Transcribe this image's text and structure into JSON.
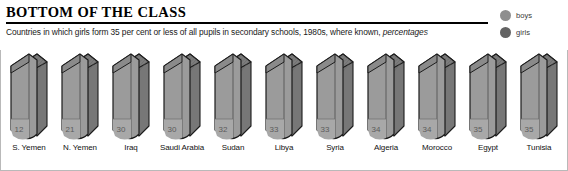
{
  "header": {
    "title": "BOTTOM OF THE CLASS",
    "subtitle_main": "Countries in which girls form 35 per cent or less of all pupils in secondary schools, 1980s, where known,",
    "subtitle_italic": "percentages"
  },
  "legend": {
    "position": "top-right",
    "items": [
      {
        "label": "boys",
        "color": "#8e8e8e",
        "icon": "circle-icon"
      },
      {
        "label": "girls",
        "color": "#636363",
        "icon": "circle-icon"
      }
    ]
  },
  "colors": {
    "background": "#ffffff",
    "book_face": "#9b9b9b",
    "book_spine": "#8a8a8a",
    "book_pages": "#777777",
    "book_top": "#7d7d7d",
    "book_outline": "#1c1c1c",
    "value_badge": "#a8a8a8",
    "value_text": "#5b5b5b",
    "frame": "#b9b9b9",
    "text": "#111111"
  },
  "chart_data": {
    "type": "bar",
    "title": "BOTTOM OF THE CLASS",
    "subtitle": "Countries in which girls form 35 per cent or less of all pupils in secondary schools, 1980s, where known, percentages",
    "xlabel": "",
    "ylabel": "percentages",
    "ylim": [
      0,
      35
    ],
    "grid": false,
    "legend_position": "top-right",
    "categories": [
      "S. Yemen",
      "N. Yemen",
      "Iraq",
      "Saudi Arabia",
      "Sudan",
      "Libya",
      "Syria",
      "Algeria",
      "Morocco",
      "Egypt",
      "Tunisia"
    ],
    "values": [
      12,
      21,
      30,
      30,
      32,
      33,
      33,
      34,
      34,
      35,
      35
    ],
    "series": [
      {
        "name": "girls",
        "values": [
          12,
          21,
          30,
          30,
          32,
          33,
          33,
          34,
          34,
          35,
          35
        ]
      }
    ]
  },
  "books": [
    {
      "country": "S. Yemen",
      "value": "12"
    },
    {
      "country": "N. Yemen",
      "value": "21"
    },
    {
      "country": "Iraq",
      "value": "30"
    },
    {
      "country": "Saudi Arabia",
      "value": "30"
    },
    {
      "country": "Sudan",
      "value": "32"
    },
    {
      "country": "Libya",
      "value": "33"
    },
    {
      "country": "Syria",
      "value": "33"
    },
    {
      "country": "Algeria",
      "value": "34"
    },
    {
      "country": "Morocco",
      "value": "34"
    },
    {
      "country": "Egypt",
      "value": "35"
    },
    {
      "country": "Tunisia",
      "value": "35"
    }
  ]
}
